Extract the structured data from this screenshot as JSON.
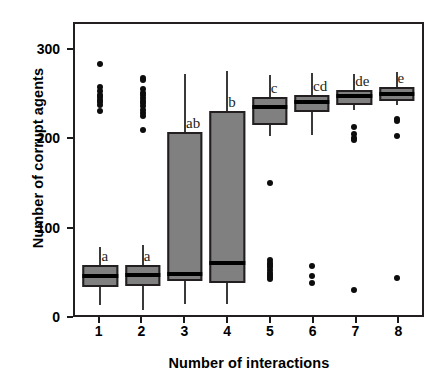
{
  "chart_data": {
    "type": "box",
    "title": "",
    "xlabel": "Number of interactions",
    "ylabel": "Number of corrupt agents",
    "xlim": [
      0.4,
      8.6
    ],
    "ylim": [
      0,
      330
    ],
    "yticks": [
      0,
      100,
      200,
      300
    ],
    "ytick_labels": [
      "0",
      "100",
      "200",
      "300"
    ],
    "xticks": [
      1,
      2,
      3,
      4,
      5,
      6,
      7,
      8
    ],
    "xtick_labels": [
      "1",
      "2",
      "3",
      "4",
      "5",
      "6",
      "7",
      "8"
    ],
    "grid": false,
    "legend": "none",
    "box_fill_color": "#808080",
    "box_edge_color": "#231f20",
    "median_color": "#000000",
    "outlier_color": "#0d0d0d",
    "frame_color": "#231f20",
    "significance_letters": [
      "a",
      "a",
      "ab",
      "b",
      "c",
      "cd",
      "de",
      "e"
    ],
    "boxes": [
      {
        "category": "1",
        "letter": "a",
        "whisker_low": 11,
        "q1": 32,
        "median": 44,
        "q3": 57,
        "whisker_high": 77,
        "outliers": [
          285,
          258,
          254,
          250,
          247,
          244,
          241,
          238,
          231
        ]
      },
      {
        "category": "2",
        "letter": "a",
        "whisker_low": 6,
        "q1": 33,
        "median": 45,
        "q3": 57,
        "whisker_high": 79,
        "outliers": [
          269,
          266,
          256,
          252,
          249,
          246,
          243,
          240,
          237,
          233,
          229,
          226,
          210
        ]
      },
      {
        "category": "3",
        "letter": "ab",
        "whisker_low": 12,
        "q1": 38,
        "median": 46,
        "q3": 208,
        "whisker_high": 273,
        "outliers": []
      },
      {
        "category": "4",
        "letter": "b",
        "whisker_low": 13,
        "q1": 36,
        "median": 59,
        "q3": 231,
        "whisker_high": 277,
        "outliers": []
      },
      {
        "category": "5",
        "letter": "c",
        "whisker_low": 203,
        "q1": 216,
        "median": 236,
        "q3": 247,
        "whisker_high": 272,
        "outliers": [
          150,
          62,
          59,
          57,
          54,
          51,
          48,
          45,
          43,
          41
        ]
      },
      {
        "category": "6",
        "letter": "cd",
        "whisker_low": 204,
        "q1": 230,
        "median": 242,
        "q3": 250,
        "whisker_high": 275,
        "outliers": [
          56,
          44,
          36
        ]
      },
      {
        "category": "7",
        "letter": "de",
        "whisker_low": 233,
        "q1": 238,
        "median": 248,
        "q3": 255,
        "whisker_high": 273,
        "outliers": [
          213,
          205,
          201,
          198,
          28
        ]
      },
      {
        "category": "8",
        "letter": "e",
        "whisker_low": 238,
        "q1": 243,
        "median": 251,
        "q3": 258,
        "whisker_high": 276,
        "outliers": [
          222,
          220,
          203,
          42
        ]
      }
    ]
  }
}
